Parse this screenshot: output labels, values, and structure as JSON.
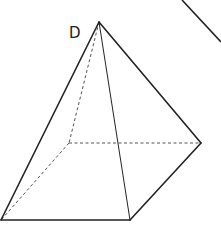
{
  "diagram": {
    "type": "geometric-solid",
    "stroke_color": "#222222",
    "hidden_stroke_color": "#555555",
    "labels": {
      "apex": "D"
    },
    "vertices": {
      "apex_D": [
        99,
        22
      ],
      "base_back_left": [
        69,
        143
      ],
      "base_right": [
        201,
        143
      ],
      "base_front_left": [
        1,
        220
      ],
      "base_front_right": [
        130,
        220
      ]
    },
    "visible_edges": [
      [
        "apex_D",
        "base_front_left"
      ],
      [
        "apex_D",
        "base_front_right"
      ],
      [
        "apex_D",
        "base_right"
      ],
      [
        "base_front_left",
        "base_front_right"
      ],
      [
        "base_front_right",
        "base_right"
      ]
    ],
    "hidden_edges": [
      [
        "apex_D",
        "base_back_left"
      ],
      [
        "base_back_left",
        "base_front_left"
      ],
      [
        "base_back_left",
        "base_right"
      ]
    ],
    "extra_line": {
      "from": [
        182,
        0
      ],
      "to": [
        221,
        42
      ]
    }
  }
}
